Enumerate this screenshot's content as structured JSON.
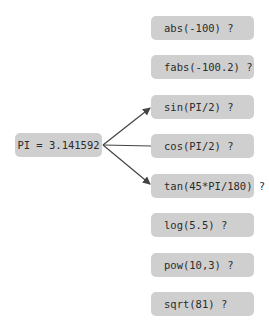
{
  "source": {
    "label": "PI = 3.141592"
  },
  "functions": [
    {
      "label": "abs(-100) ?",
      "connected": false
    },
    {
      "label": "fabs(-100.2) ?",
      "connected": false
    },
    {
      "label": "sin(PI/2) ?",
      "connected": true
    },
    {
      "label": "cos(PI/2) ?",
      "connected": true
    },
    {
      "label": "tan(45*PI/180) ?",
      "connected": true
    },
    {
      "label": "log(5.5) ?",
      "connected": false
    },
    {
      "label": "pow(10,3) ?",
      "connected": false
    },
    {
      "label": "sqrt(81) ?",
      "connected": false
    }
  ],
  "colors": {
    "box": "#cfcfcf",
    "text": "#2b2b2b",
    "arrow": "#444444"
  }
}
